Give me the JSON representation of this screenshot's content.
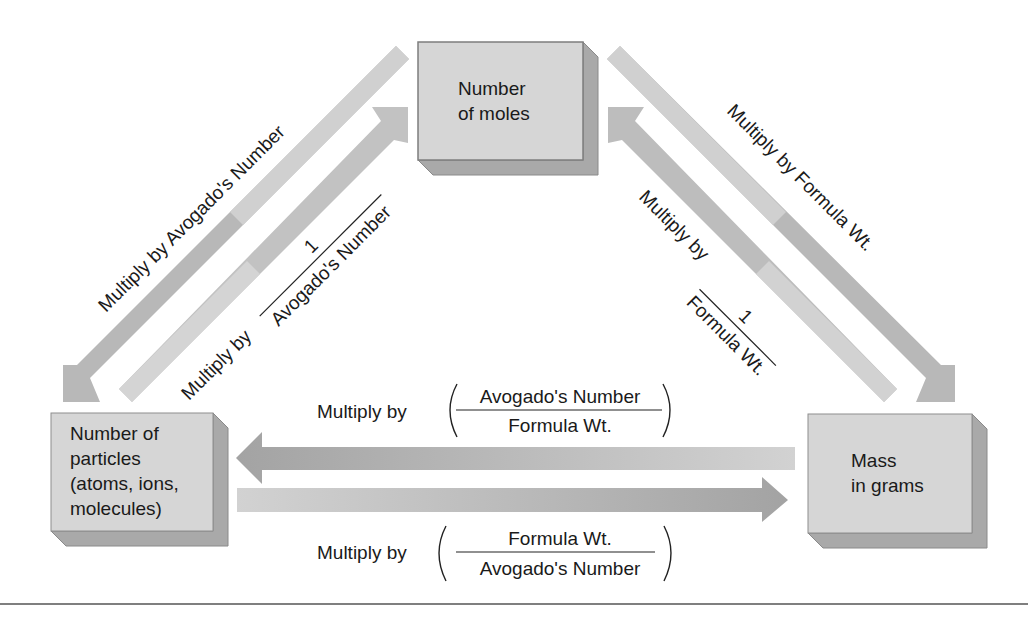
{
  "boxes": {
    "moles": {
      "line1": "Number",
      "line2": "of moles"
    },
    "particles": {
      "line1": "Number of",
      "line2": "particles",
      "line3": "(atoms, ions,",
      "line4": "molecules)"
    },
    "mass": {
      "line1": "Mass",
      "line2": "in grams"
    }
  },
  "labels": {
    "moles_to_particles": "Multiply by Avogado's Number",
    "particles_to_moles": {
      "prefix": "Multiply by",
      "numerator": "1",
      "denominator": "Avogado's Number"
    },
    "moles_to_mass": "Multiply by Formula Wt.",
    "mass_to_moles": {
      "prefix": "Multiply by",
      "numerator": "1",
      "denominator": "Formula Wt."
    },
    "mass_to_particles": {
      "prefix": "Multiply by",
      "numerator": "Avogado's Number",
      "denominator": "Formula Wt."
    },
    "particles_to_mass": {
      "prefix": "Multiply by",
      "numerator": "Formula Wt.",
      "denominator": "Avogado's Number"
    }
  },
  "colors": {
    "box_face": "#d6d6d6",
    "box_side": "#a9a9a9",
    "box_border": "#8a8a8a",
    "arrow_dark": "#a6a6a6",
    "arrow_light": "#cfcfcf",
    "rule": "#555555"
  }
}
